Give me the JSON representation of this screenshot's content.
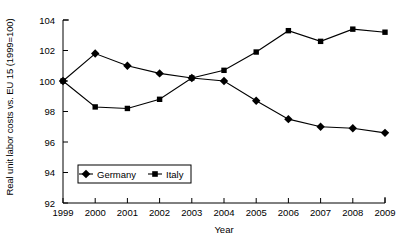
{
  "chart_data": {
    "type": "line",
    "title": "",
    "xlabel": "Year",
    "ylabel": "Real unit labor costs vs. EU 15 (1999=100)",
    "categories": [
      "1999",
      "2000",
      "2001",
      "2002",
      "2003",
      "2004",
      "2005",
      "2006",
      "2007",
      "2008",
      "2009"
    ],
    "x": [
      1999,
      2000,
      2001,
      2002,
      2003,
      2004,
      2005,
      2006,
      2007,
      2008,
      2009
    ],
    "series": [
      {
        "name": "Germany",
        "marker": "diamond",
        "color": "#000000",
        "values": [
          100.0,
          101.8,
          101.0,
          100.5,
          100.2,
          100.0,
          98.7,
          97.5,
          97.0,
          96.9,
          96.6
        ]
      },
      {
        "name": "Italy",
        "marker": "square",
        "color": "#000000",
        "values": [
          100.0,
          98.3,
          98.2,
          98.8,
          100.2,
          100.7,
          101.9,
          103.3,
          102.6,
          103.4,
          103.2
        ]
      }
    ],
    "ylim": [
      92,
      104
    ],
    "yticks": [
      92,
      94,
      96,
      98,
      100,
      102,
      104
    ],
    "ytick_labels": [
      "92",
      "94",
      "96",
      "98",
      "100",
      "102",
      "104"
    ],
    "xlim": [
      1999,
      2009
    ],
    "grid": false,
    "legend": {
      "position": "inside-lower-left",
      "entries": [
        {
          "label": "Germany",
          "marker": "diamond"
        },
        {
          "label": "Italy",
          "marker": "square"
        }
      ]
    }
  }
}
